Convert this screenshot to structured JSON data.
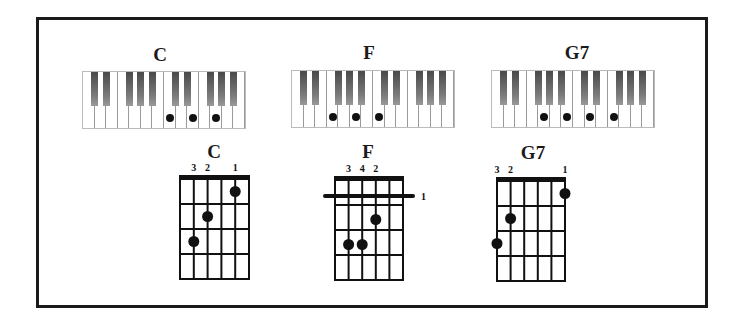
{
  "piano_chords": [
    {
      "name": "C",
      "notes": [
        "C",
        "E",
        "G"
      ],
      "dot_keys": [
        7,
        9,
        11
      ]
    },
    {
      "name": "F",
      "notes": [
        "F",
        "A",
        "C"
      ],
      "dot_keys": [
        3,
        5,
        7
      ]
    },
    {
      "name": "G7",
      "notes": [
        "G",
        "B",
        "D",
        "F"
      ],
      "dot_keys": [
        4,
        6,
        8,
        10
      ]
    }
  ],
  "guitar_chords": [
    {
      "name": "C",
      "fingers": [
        {
          "label": "3",
          "string": 1
        },
        {
          "label": "2",
          "string": 2
        },
        {
          "label": "1",
          "string": 4
        }
      ],
      "dots": [
        {
          "string": 1,
          "fret": 3
        },
        {
          "string": 2,
          "fret": 2
        },
        {
          "string": 4,
          "fret": 1
        }
      ],
      "barre": null
    },
    {
      "name": "F",
      "fingers": [
        {
          "label": "3",
          "string": 1
        },
        {
          "label": "4",
          "string": 2
        },
        {
          "label": "2",
          "string": 3
        }
      ],
      "dots": [
        {
          "string": 3,
          "fret": 2
        },
        {
          "string": 1,
          "fret": 3
        },
        {
          "string": 2,
          "fret": 3
        }
      ],
      "barre": {
        "fret": 1,
        "label": "1"
      }
    },
    {
      "name": "G7",
      "fingers": [
        {
          "label": "3",
          "string": 0
        },
        {
          "label": "2",
          "string": 1
        },
        {
          "label": "1",
          "string": 5
        }
      ],
      "dots": [
        {
          "string": 0,
          "fret": 3
        },
        {
          "string": 1,
          "fret": 2
        },
        {
          "string": 5,
          "fret": 1
        }
      ],
      "barre": null
    }
  ],
  "colors": {
    "ink": "#1a1a1a",
    "key_border": "#9a9a9a",
    "black_key": "#5a5a5a"
  }
}
